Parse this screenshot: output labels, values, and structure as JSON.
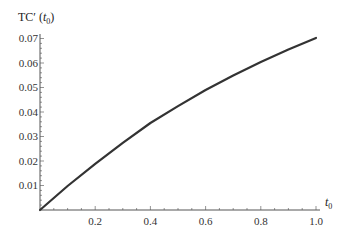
{
  "chart_data": {
    "type": "line",
    "title": "",
    "xlabel": "t0",
    "ylabel": "TC′ (t0)",
    "xlim": [
      0,
      1.0
    ],
    "ylim": [
      0,
      0.07
    ],
    "grid": false,
    "legend": null,
    "x_ticks": [
      "0.2",
      "0.4",
      "0.6",
      "0.8",
      "1.0"
    ],
    "y_ticks": [
      "0.01",
      "0.02",
      "0.03",
      "0.04",
      "0.05",
      "0.06",
      "0.07"
    ],
    "series": [
      {
        "name": "TC′(t0)",
        "color": "#333333",
        "x": [
          0,
          0.1,
          0.2,
          0.3,
          0.4,
          0.5,
          0.6,
          0.7,
          0.8,
          0.9,
          1.0
        ],
        "values": [
          0,
          0.0098,
          0.0188,
          0.0274,
          0.0355,
          0.0424,
          0.049,
          0.0549,
          0.0604,
          0.0655,
          0.0702
        ]
      }
    ]
  },
  "labels": {
    "y_axis_main": "TC′ (",
    "y_axis_sub_t": "t",
    "y_axis_sub_0": "0",
    "y_axis_close": ")",
    "x_axis_t": "t",
    "x_axis_0": "0"
  }
}
